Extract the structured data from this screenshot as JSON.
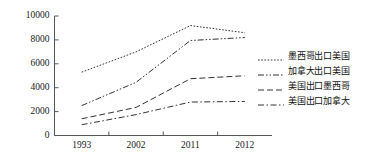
{
  "chart_data": {
    "type": "line",
    "title": "",
    "xlabel": "",
    "ylabel": "",
    "categories": [
      "1993",
      "2002",
      "2011",
      "2012"
    ],
    "x_tick_labels": [
      "1993",
      "2002",
      "2011",
      "2012"
    ],
    "y_tick_labels": [
      "0",
      "2000",
      "4000",
      "6000",
      "8000",
      "10000"
    ],
    "y_ticks": [
      0,
      2000,
      4000,
      6000,
      8000,
      10000
    ],
    "ylim": [
      0,
      10000
    ],
    "grid": false,
    "legend_position": "right",
    "series": [
      {
        "name": "墨西哥出口美国",
        "values": [
          5300,
          7000,
          9200,
          8600
        ],
        "line_style": "dotted",
        "color": "#333333"
      },
      {
        "name": "加拿大出口美国",
        "values": [
          2500,
          4450,
          7950,
          8200
        ],
        "line_style": "dash-dot-dot",
        "color": "#333333"
      },
      {
        "name": "美国出口墨西哥",
        "values": [
          1400,
          2350,
          4750,
          5000
        ],
        "line_style": "dashed",
        "color": "#333333"
      },
      {
        "name": "美国出口加拿大",
        "values": [
          900,
          1750,
          2800,
          2850
        ],
        "line_style": "dash-dot",
        "color": "#333333"
      }
    ]
  },
  "legend": {
    "items": [
      {
        "label": "墨西哥出口美国"
      },
      {
        "label": "加拿大出口美国"
      },
      {
        "label": "美国出口墨西哥"
      },
      {
        "label": "美国出口加拿大"
      }
    ]
  },
  "axis": {
    "y_labels": [
      "10000",
      "8000",
      "6000",
      "4000",
      "2000",
      "0"
    ],
    "x_labels": [
      "1993",
      "2002",
      "2011",
      "2012"
    ]
  },
  "colors": {
    "line": "#333333",
    "axis": "#555555",
    "text": "#1a1a1a",
    "background": "#ffffff"
  }
}
